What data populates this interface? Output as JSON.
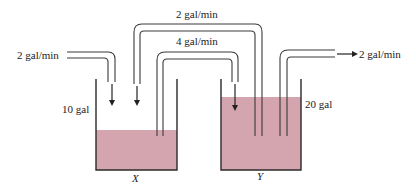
{
  "diagram": {
    "type": "two-tank mixing system",
    "colors": {
      "liquid": "#d4a5ae",
      "lines": "#2a2a2a",
      "background": "#ffffff"
    },
    "tanks": [
      {
        "id": "X",
        "label": "X",
        "volume_label": "10 gal",
        "fill_fraction": 0.43
      },
      {
        "id": "Y",
        "label": "Y",
        "volume_label": "20 gal",
        "fill_fraction": 0.8
      }
    ],
    "flows": [
      {
        "id": "inflow-x",
        "from": "outside",
        "to": "X",
        "rate_label": "2 gal/min"
      },
      {
        "id": "y-to-x",
        "from": "Y",
        "to": "X",
        "rate_label": "2 gal/min"
      },
      {
        "id": "x-to-y",
        "from": "X",
        "to": "Y",
        "rate_label": "4 gal/min"
      },
      {
        "id": "outflow-y",
        "from": "Y",
        "to": "outside",
        "rate_label": "2 gal/min"
      }
    ]
  }
}
